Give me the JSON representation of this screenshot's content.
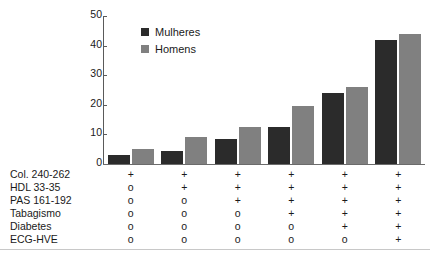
{
  "chart_data": {
    "type": "bar",
    "title": "",
    "xlabel": "",
    "ylabel": "",
    "ylim": [
      0,
      50
    ],
    "yticks": [
      0,
      10,
      20,
      30,
      40,
      50
    ],
    "grid": false,
    "legend_position": "top-left-inside",
    "categories": [
      "1",
      "2",
      "3",
      "4",
      "5",
      "6"
    ],
    "series": [
      {
        "name": "Mulheres",
        "color": "#2b2b2b",
        "values": [
          3,
          4.5,
          8.5,
          12.5,
          24,
          42
        ]
      },
      {
        "name": "Homens",
        "color": "#808080",
        "values": [
          5,
          9,
          12.5,
          19.5,
          26,
          44
        ]
      }
    ],
    "factor_rows": [
      {
        "label": "Col. 240-262",
        "values": [
          "+",
          "+",
          "+",
          "+",
          "+",
          "+"
        ]
      },
      {
        "label": "HDL 33-35",
        "values": [
          "o",
          "+",
          "+",
          "+",
          "+",
          "+"
        ]
      },
      {
        "label": "PAS 161-192",
        "values": [
          "o",
          "o",
          "+",
          "+",
          "+",
          "+"
        ]
      },
      {
        "label": "Tabagismo",
        "values": [
          "o",
          "o",
          "o",
          "+",
          "+",
          "+"
        ]
      },
      {
        "label": "Diabetes",
        "values": [
          "o",
          "o",
          "o",
          "o",
          "+",
          "+"
        ]
      },
      {
        "label": "ECG-HVE",
        "values": [
          "o",
          "o",
          "o",
          "o",
          "o",
          "+"
        ]
      }
    ]
  },
  "colors": {
    "women": "#2b2b2b",
    "men": "#808080",
    "axis": "#5a5a5a",
    "rule": "#6b6b6b",
    "text": "#1a1a1a",
    "background": "#ffffff"
  }
}
